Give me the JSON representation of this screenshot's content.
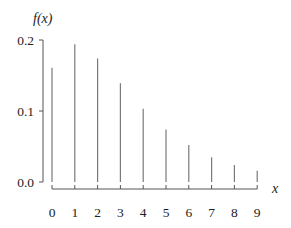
{
  "chart_data": {
    "type": "bar",
    "style": "stem",
    "title": "",
    "xlabel": "x",
    "ylabel": "f(x)",
    "categories": [
      "0",
      "1",
      "2",
      "3",
      "4",
      "5",
      "6",
      "7",
      "8",
      "9"
    ],
    "x": [
      0,
      1,
      2,
      3,
      4,
      5,
      6,
      7,
      8,
      9
    ],
    "values": [
      0.161,
      0.194,
      0.174,
      0.139,
      0.103,
      0.074,
      0.052,
      0.035,
      0.024,
      0.016
    ],
    "ylim": [
      0,
      0.2
    ],
    "yticks": [
      0.0,
      0.1,
      0.2
    ],
    "ytick_labels": [
      "0.0",
      "0.1",
      "0.2"
    ],
    "xticks": [
      0,
      1,
      2,
      3,
      4,
      5,
      6,
      7,
      8,
      9
    ],
    "xtick_labels": [
      "0",
      "1",
      "2",
      "3",
      "4",
      "5",
      "6",
      "7",
      "8",
      "9"
    ],
    "grid": false,
    "legend": null
  },
  "colors": {
    "stem": "#7a7a7a",
    "axis": "#555555",
    "text": "#222222"
  },
  "labels": {
    "ylabel": "f(x)",
    "xlabel": "x"
  }
}
